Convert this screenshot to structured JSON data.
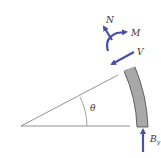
{
  "diagram": {
    "labels": {
      "theta": "θ",
      "normal_force": "N",
      "moment": "M",
      "shear": "V",
      "reaction": "B",
      "reaction_sub": "y"
    },
    "colors": {
      "arrow": "#4a4ea8",
      "member_fill": "#a8a8a8",
      "member_stroke": "#333333",
      "line": "#666666"
    }
  }
}
